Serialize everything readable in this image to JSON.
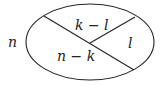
{
  "diagram": {
    "type": "set-partition",
    "outer_label": "n",
    "regions": [
      {
        "id": "top",
        "label": "k − l"
      },
      {
        "id": "right",
        "label": "l"
      },
      {
        "id": "bottom-left",
        "label": "n − k"
      }
    ],
    "colors": {
      "stroke": "#222222",
      "background": "#ffffff"
    }
  }
}
